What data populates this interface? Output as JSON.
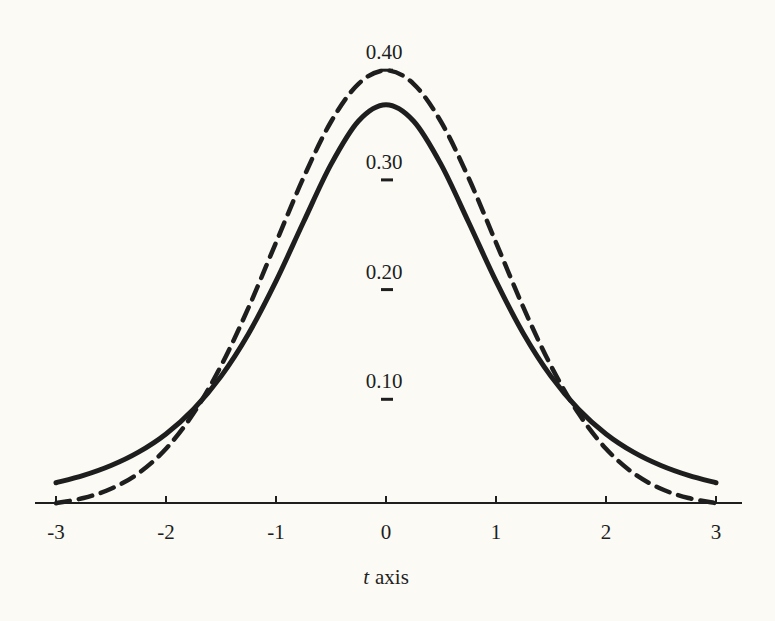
{
  "chart_data": {
    "type": "line",
    "title": "",
    "xlabel_var": "t",
    "xlabel_rest": "axis",
    "ylabel": "",
    "xlim": [
      -3,
      3
    ],
    "ylim": [
      0,
      0.4
    ],
    "x_ticks": [
      "-3",
      "-2",
      "-1",
      "0",
      "1",
      "2",
      "3"
    ],
    "y_ticks": [
      "0.10",
      "0.20",
      "0.30",
      "0.40"
    ],
    "grid": false,
    "legend": null,
    "x": [
      -3,
      -2.75,
      -2.5,
      -2.25,
      -2,
      -1.75,
      -1.5,
      -1.25,
      -1,
      -0.75,
      -0.5,
      -0.25,
      0,
      0.25,
      0.5,
      0.75,
      1,
      1.25,
      1.5,
      1.75,
      2,
      2.25,
      2.5,
      2.75,
      3
    ],
    "series": [
      {
        "name": "solid curve (heavier-tailed, t-like)",
        "style": "solid",
        "values": [
          0.023,
          0.0297,
          0.0387,
          0.0509,
          0.0675,
          0.09,
          0.12,
          0.1589,
          0.2068,
          0.2607,
          0.3132,
          0.3528,
          0.3676,
          0.3528,
          0.3132,
          0.2607,
          0.2068,
          0.1589,
          0.12,
          0.09,
          0.0675,
          0.0509,
          0.0387,
          0.0297,
          0.023
        ]
      },
      {
        "name": "dashed curve (normal)",
        "style": "dashed",
        "values": [
          0.0044,
          0.0091,
          0.0175,
          0.0317,
          0.054,
          0.0863,
          0.1295,
          0.1826,
          0.242,
          0.3011,
          0.3521,
          0.3867,
          0.3989,
          0.3867,
          0.3521,
          0.3011,
          0.242,
          0.1826,
          0.1295,
          0.0863,
          0.054,
          0.0317,
          0.0175,
          0.0091,
          0.0044
        ]
      }
    ]
  }
}
